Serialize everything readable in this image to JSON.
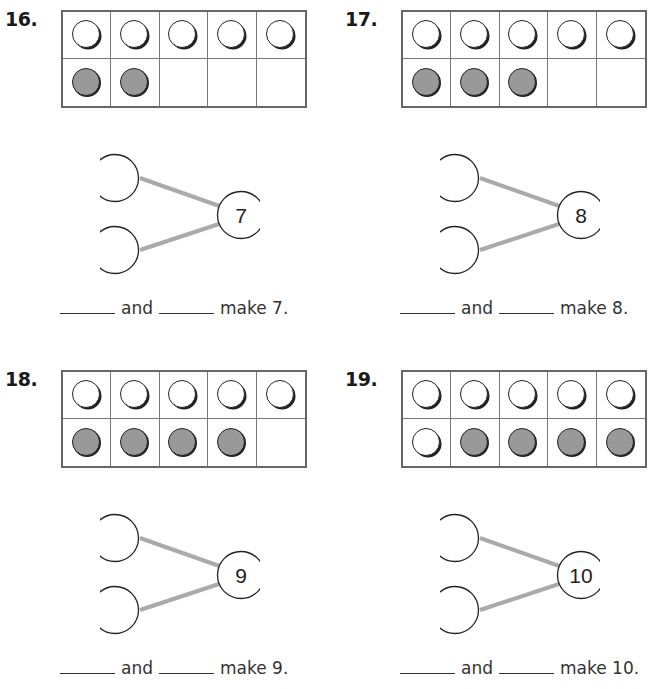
{
  "colors": {
    "frame_border": "#666666",
    "counter_gray": "#999999",
    "bond_line": "#aaaaaa"
  },
  "problems": [
    {
      "number": "16.",
      "top_row": [
        "white",
        "white",
        "white",
        "white",
        "white"
      ],
      "bottom_row": [
        "gray",
        "gray",
        "empty",
        "empty",
        "empty"
      ],
      "whole": "7",
      "sentence": {
        "and": "and",
        "make": "make 7."
      }
    },
    {
      "number": "17.",
      "top_row": [
        "white",
        "white",
        "white",
        "white",
        "white"
      ],
      "bottom_row": [
        "gray",
        "gray",
        "gray",
        "empty",
        "empty"
      ],
      "whole": "8",
      "sentence": {
        "and": "and",
        "make": "make 8."
      }
    },
    {
      "number": "18.",
      "top_row": [
        "white",
        "white",
        "white",
        "white",
        "white"
      ],
      "bottom_row": [
        "gray",
        "gray",
        "gray",
        "gray",
        "empty"
      ],
      "whole": "9",
      "sentence": {
        "and": "and",
        "make": "make 9."
      }
    },
    {
      "number": "19.",
      "top_row": [
        "white",
        "white",
        "white",
        "white",
        "white"
      ],
      "bottom_row": [
        "white",
        "gray",
        "gray",
        "gray",
        "gray"
      ],
      "whole": "10",
      "sentence": {
        "and": "and",
        "make": "make 10."
      }
    }
  ]
}
